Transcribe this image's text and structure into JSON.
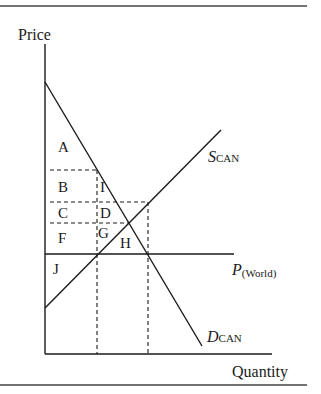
{
  "diagram": {
    "type": "supply-demand-tariff",
    "axes": {
      "y_label": "Price",
      "x_label": "Quantity"
    },
    "curves": {
      "supply": {
        "main": "S",
        "sub": "CAN"
      },
      "demand": {
        "main": "D",
        "sub": "CAN"
      },
      "world_price": {
        "main": "P",
        "sub": "(World)"
      }
    },
    "regions": {
      "A": "A",
      "B": "B",
      "C": "C",
      "D": "D",
      "F": "F",
      "G": "G",
      "H": "H",
      "I": "I",
      "J": "J"
    },
    "colors": {
      "line": "#1a1a1a",
      "background": "#ffffff"
    }
  }
}
